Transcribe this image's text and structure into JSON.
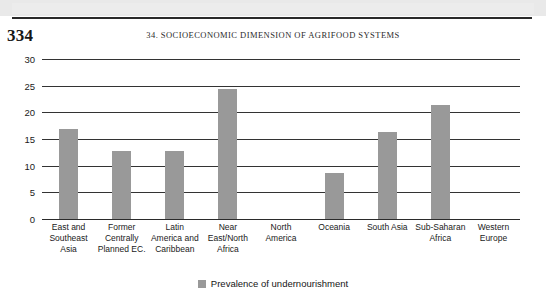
{
  "page": {
    "page_number": "334",
    "running_head": "34. SOCIOECONOMIC DIMENSION OF AGRIFOOD SYSTEMS"
  },
  "legend": {
    "series_label": "Prevalence of undernourishment",
    "swatch_color": "#999999",
    "position": "bottom-center"
  },
  "chart_data": {
    "type": "bar",
    "title": "",
    "xlabel": "",
    "ylabel": "",
    "ylim": [
      0,
      30
    ],
    "yticks": [
      0,
      5,
      10,
      15,
      20,
      25,
      30
    ],
    "grid": true,
    "bar_color": "#999999",
    "categories": [
      "East and Southeast Asia",
      "Former Centrally Planned EC.",
      "Latin America and Caribbean",
      "Near East/North Africa",
      "North America",
      "Oceania",
      "South Asia",
      "Sub-Saharan Africa",
      "Western Europe"
    ],
    "category_lines": [
      [
        "East and",
        "Southeast",
        "Asia"
      ],
      [
        "Former",
        "Centrally",
        "Planned EC."
      ],
      [
        "Latin",
        "America and",
        "Caribbean"
      ],
      [
        "Near",
        "East/North",
        "Africa"
      ],
      [
        "North",
        "America"
      ],
      [
        "Oceania"
      ],
      [
        "South Asia"
      ],
      [
        "Sub-Saharan",
        "Africa"
      ],
      [
        "Western",
        "Europe"
      ]
    ],
    "series": [
      {
        "name": "Prevalence of undernourishment",
        "values": [
          17.0,
          13.0,
          13.0,
          24.5,
          0,
          8.8,
          16.5,
          21.5,
          0
        ]
      }
    ]
  }
}
